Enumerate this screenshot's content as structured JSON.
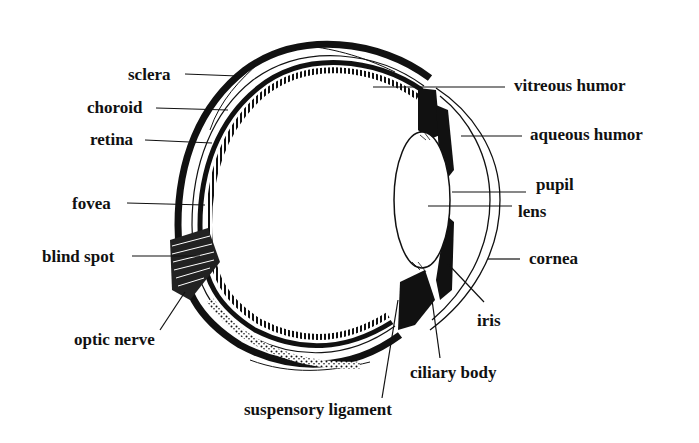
{
  "diagram": {
    "colors": {
      "ink": "#111111",
      "background": "#ffffff"
    },
    "labels": {
      "sclera": "sclera",
      "choroid": "choroid",
      "retina": "retina",
      "fovea": "fovea",
      "blind_spot": "blind spot",
      "optic_nerve": "optic nerve",
      "suspensory_ligament": "suspensory ligament",
      "ciliary_body": "ciliary body",
      "iris": "iris",
      "cornea": "cornea",
      "lens": "lens",
      "pupil": "pupil",
      "aqueous_humor": "aqueous humor",
      "vitreous_humor": "vitreous humor"
    }
  }
}
